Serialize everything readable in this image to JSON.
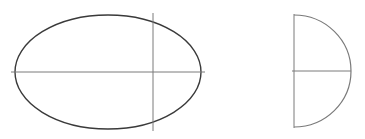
{
  "figure": {
    "background": "#ffffff",
    "left_shape": {
      "kind": "ellipse",
      "stroke": "#3a3a3a",
      "cx": 108,
      "cy": 72,
      "rx": 93,
      "ry": 57,
      "horizontal_axis": {
        "x1": 11,
        "y1": 72,
        "x2": 205,
        "y2": 72,
        "stroke": "#7a7a7a"
      },
      "vertical_line": {
        "x1": 153,
        "y1": 13,
        "x2": 153,
        "y2": 131,
        "stroke": "#7a7a7a"
      }
    },
    "right_shape": {
      "kind": "half-ellipse-cap",
      "stroke": "#7a7a7a",
      "vertical_line": {
        "x1": 294,
        "y1": 14,
        "x2": 294,
        "y2": 128
      },
      "horizontal_axis": {
        "x1": 292,
        "y1": 71,
        "x2": 351,
        "y2": 71
      },
      "curve": {
        "start": [
          294,
          15
        ],
        "apex": [
          351,
          71
        ],
        "end": [
          294,
          127
        ]
      }
    }
  }
}
